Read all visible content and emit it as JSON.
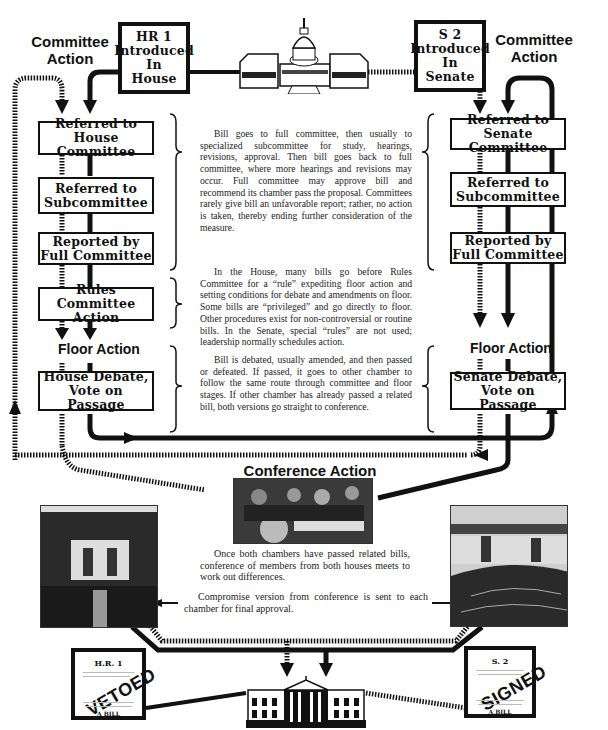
{
  "diagram": {
    "title_area": {
      "house_heading": "Committee\nAction",
      "senate_heading": "Committee\nAction",
      "capitol_icon": "capitol-building-icon"
    },
    "house": {
      "introduced": [
        "HR 1",
        "Introduced",
        "In House"
      ],
      "steps": [
        {
          "label": "Referred to\nHouse Committee"
        },
        {
          "label": "Referred to\nSubcommittee"
        },
        {
          "label": "Reported by\nFull Committee"
        },
        {
          "label": "Rules Committee\nAction"
        }
      ],
      "floor_heading": "Floor Action",
      "floor_step": "House Debate,\nVote on Passage"
    },
    "senate": {
      "introduced": [
        "S 2",
        "Introduced",
        "In Senate"
      ],
      "steps": [
        {
          "label": "Referred to\nSenate Committee"
        },
        {
          "label": "Referred to\nSubcommittee"
        },
        {
          "label": "Reported by\nFull Committee"
        }
      ],
      "floor_heading": "Floor Action",
      "floor_step": "Senate Debate,\nVote on Passage"
    },
    "explanations": {
      "committee": "Bill goes to full committee, then usually to specialized subcommittee for study, hearings, revisions, approval. Then bill goes back to full committee, where more hearings and revisions may occur. Full committee may approve bill and recommend its chamber pass the proposal. Committees rarely give bill an unfavorable report; rather, no action is taken, thereby ending further consideration of the measure.",
      "rules": "In the House, many bills go before Rules Committee for a “rule” expediting floor action and setting conditions for debate and amendments on floor. Some bills are “privileged” and go directly to floor. Other procedures exist for non-controversial or routine bills. In the Senate, special “rules” are not used; leadership normally schedules action.",
      "floor": "Bill is debated, usually amended, and then passed or defeated. If passed, it goes to other chamber to follow the same route through committee and floor stages. If other chamber has already passed a related bill, both versions go straight to conference."
    },
    "conference": {
      "heading": "Conference Action",
      "text1": "Once both chambers have passed related bills, conference of members from both houses meets to work out differences.",
      "text2": "Compromise version from conference is sent to each chamber for final approval."
    },
    "outcomes": {
      "vetoed_doc": {
        "bill_id": "H.R. 1",
        "stamp": "VETOED",
        "subtitle": "A BILL"
      },
      "signed_doc": {
        "bill_id": "S. 2",
        "stamp": "SIGNED",
        "subtitle": "A BILL"
      },
      "white_house_icon": "white-house-icon"
    },
    "colors": {
      "ink": "#111111",
      "paper": "#ffffff",
      "photo_dark": "#2c2c2c"
    }
  }
}
